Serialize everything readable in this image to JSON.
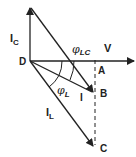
{
  "diagram": {
    "type": "phasor-diagram",
    "colors": {
      "line": "#222222",
      "background": "#ffffff"
    },
    "labels": {
      "ic": {
        "main": "I",
        "sub": "C"
      },
      "phi_lc": {
        "main": "φ",
        "sub": "LC"
      },
      "v": "V",
      "d": "D",
      "a": "A",
      "b": "B",
      "i": "I",
      "phi_l": {
        "main": "φ",
        "sub": "L"
      },
      "il": {
        "main": "I",
        "sub": "L"
      },
      "c": "C"
    },
    "vectors": [
      {
        "name": "V",
        "from": "D",
        "direction": "horizontal-right"
      },
      {
        "name": "I_C",
        "from": "D",
        "direction": "vertical-up"
      },
      {
        "name": "I",
        "from": "D",
        "to": "B"
      },
      {
        "name": "I_L",
        "from": "D",
        "to": "C"
      },
      {
        "name": "I_C-shifted",
        "from": "C-top",
        "to": "B"
      }
    ],
    "angles": [
      "φ_L",
      "φ_LC"
    ],
    "construction": "dashed vertical line A–B–C"
  }
}
